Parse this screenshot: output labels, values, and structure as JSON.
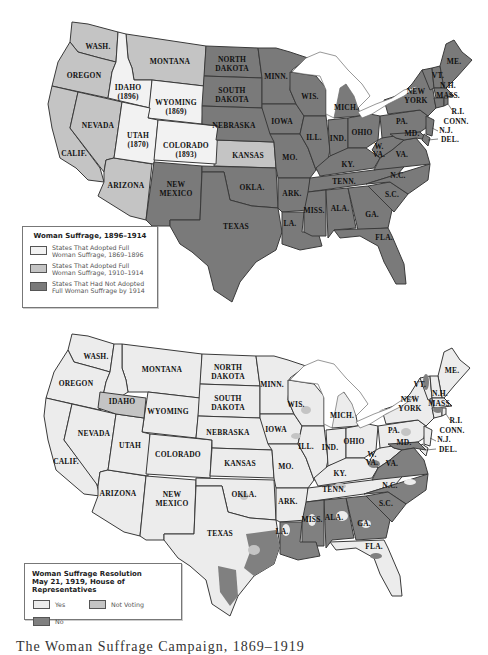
{
  "colors": {
    "adopted_1869_1896": "#f2f2f2",
    "adopted_1910_1914": "#c4c4c4",
    "not_adopted_1914": "#7a7a7a",
    "vote_yes": "#ececec",
    "vote_not_voting": "#c4c4c4",
    "vote_no": "#808080",
    "border": "#3a3a3a"
  },
  "map1": {
    "legend": {
      "title": "Woman Suffrage, 1896–1914",
      "items": [
        {
          "line1": "States That Adopted Full",
          "line2": "Woman Suffrage, 1869–1896",
          "category": "adopted_1869_1896"
        },
        {
          "line1": "States That Adopted Full",
          "line2": "Woman Suffrage, 1910–1914",
          "category": "adopted_1910_1914"
        },
        {
          "line1": "States That Had Not Adopted",
          "line2": "Full Woman Suffrage by 1914",
          "category": "not_adopted_1914"
        }
      ]
    },
    "labels": {
      "wash": "WASH.",
      "oregon": "OREGON",
      "calif": "CALIF.",
      "nevada": "NEVADA",
      "idaho": "IDAHO",
      "idaho_year": "(1896)",
      "montana": "MONTANA",
      "wyoming": "WYOMING",
      "wyoming_year": "(1869)",
      "utah": "UTAH",
      "utah_year": "(1870)",
      "colorado": "COLORADO",
      "colorado_year": "(1893)",
      "arizona": "ARIZONA",
      "new": "NEW",
      "mexico": "MEXICO",
      "north": "NORTH",
      "south": "SOUTH",
      "dakota": "DAKOTA",
      "nebraska": "NEBRASKA",
      "kansas": "KANSAS",
      "okla": "OKLA.",
      "texas": "TEXAS",
      "minn": "MINN.",
      "iowa": "IOWA",
      "mo": "MO.",
      "ark": "ARK.",
      "la": "LA.",
      "wis": "WIS.",
      "ill": "ILL.",
      "mich": "MICH.",
      "ind": "IND.",
      "ohio": "OHIO",
      "ky": "KY.",
      "tenn": "TENN.",
      "miss": "MISS.",
      "ala": "ALA.",
      "ga": "GA.",
      "fla": "FLA.",
      "sc": "S.C.",
      "nc": "N.C.",
      "va": "VA.",
      "w": "W.",
      "va2": "VA.",
      "pa": "PA.",
      "york": "YORK",
      "md": "MD.",
      "nj": "N.J.",
      "del": "DEL.",
      "conn": "CONN.",
      "ri": "R.I.",
      "mass": "MASS.",
      "nh": "N.H.",
      "vt": "VT.",
      "me": "ME."
    },
    "states": {
      "WA": "adopted_1910_1914",
      "OR": "adopted_1910_1914",
      "CA": "adopted_1910_1914",
      "NV": "adopted_1910_1914",
      "AZ": "adopted_1910_1914",
      "MT": "adopted_1910_1914",
      "KS": "adopted_1910_1914",
      "ID": "adopted_1869_1896",
      "WY": "adopted_1869_1896",
      "UT": "adopted_1869_1896",
      "CO": "adopted_1869_1896"
    }
  },
  "map2": {
    "legend": {
      "title_line1": "Woman Suffrage Resolution",
      "title_line2": "May 21, 1919, House of Representatives",
      "items": [
        {
          "label": "Yes",
          "category": "vote_yes"
        },
        {
          "label": "Not Voting",
          "category": "vote_not_voting"
        },
        {
          "label": "No",
          "category": "vote_no"
        }
      ]
    },
    "labels": {
      "wash": "WASH.",
      "oregon": "OREGON",
      "calif": "CALIF.",
      "nevada": "NEVADA",
      "idaho": "IDAHO",
      "montana": "MONTANA",
      "wyoming": "WYOMING",
      "utah": "UTAH",
      "colorado": "COLORADO",
      "arizona": "ARIZONA",
      "new": "NEW",
      "mexico": "MEXICO",
      "north": "NORTH",
      "south": "SOUTH",
      "dakota": "DAKOTA",
      "nebraska": "NEBRASKA",
      "kansas": "KANSAS",
      "okla": "OKLA.",
      "texas": "TEXAS",
      "minn": "MINN.",
      "iowa": "IOWA",
      "mo": "MO.",
      "ark": "ARK.",
      "la": "LA.",
      "wis": "WIS.",
      "ill": "ILL.",
      "mich": "MICH.",
      "ind": "IND.",
      "ohio": "OHIO",
      "ky": "KY.",
      "tenn": "TENN.",
      "miss": "MISS.",
      "ala": "ALA.",
      "ga": "GA.",
      "fla": "FLA.",
      "sc": "S.C.",
      "nc": "N.C.",
      "va": "VA.",
      "w": "W.",
      "va2": "VA.",
      "pa": "PA.",
      "york": "YORK",
      "md": "MD.",
      "nj": "N.J.",
      "del": "DEL.",
      "conn": "CONN.",
      "ri": "R.I.",
      "mass": "MASS.",
      "nh": "N.H.",
      "vt": "VT.",
      "me": "ME."
    }
  },
  "caption": "The Woman Suffrage Campaign, 1869–1919"
}
